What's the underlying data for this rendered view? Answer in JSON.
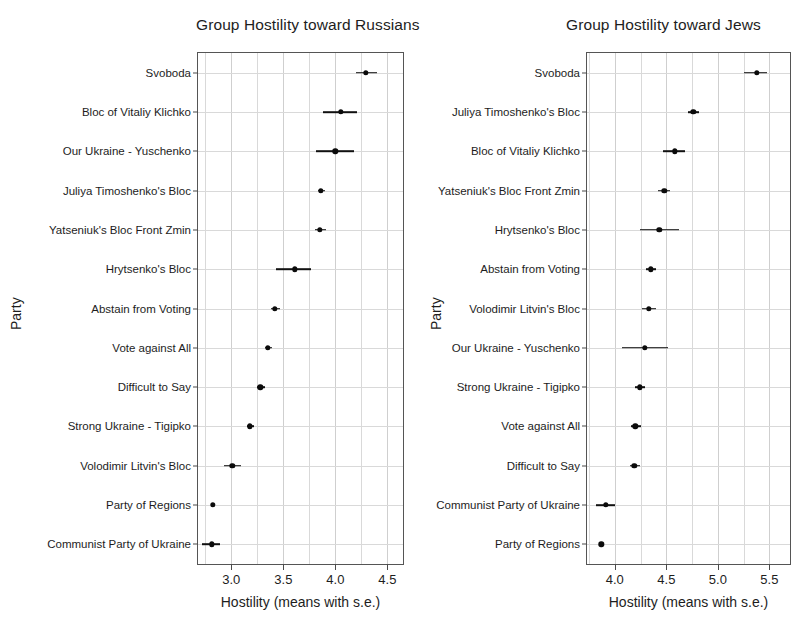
{
  "figure": {
    "y_axis_title": "Party",
    "x_axis_title": "Hostility (means with s.e.)"
  },
  "chart_data": [
    {
      "type": "scatter",
      "panel_id": "russians",
      "title": "Group Hostility toward Russians",
      "xlabel": "Hostility (means with s.e.)",
      "ylabel": "Party",
      "xlim": [
        2.68,
        4.65
      ],
      "xticks": [
        3.0,
        3.5,
        4.0,
        4.5
      ],
      "xticklabels": [
        "3.0",
        "3.5",
        "4.0",
        "4.5"
      ],
      "grid": true,
      "grid_step": 0.25,
      "orientation": "horizontal",
      "error_type": "standard error",
      "categories": [
        "Svoboda",
        "Bloc of Vitaliy Klichko",
        "Our Ukraine - Yuschenko",
        "Juliya Timoshenko's Bloc",
        "Yatseniuk's Bloc Front Zmin",
        "Hrytsenko's Bloc",
        "Abstain from Voting",
        "Vote against All",
        "Difficult to Say",
        "Strong Ukraine - Tigipko",
        "Volodimir Litvin's Bloc",
        "Party of Regions",
        "Communist Party of Ukraine"
      ],
      "values": [
        4.29,
        4.05,
        4.0,
        3.86,
        3.85,
        3.61,
        3.42,
        3.35,
        3.28,
        3.18,
        3.01,
        2.82,
        2.81
      ],
      "err_low": [
        4.2,
        3.88,
        3.81,
        3.83,
        3.8,
        3.43,
        3.38,
        3.32,
        3.25,
        3.15,
        2.93,
        2.81,
        2.72
      ],
      "err_high": [
        4.4,
        4.21,
        4.18,
        3.9,
        3.91,
        3.77,
        3.47,
        3.39,
        3.32,
        3.22,
        3.09,
        2.83,
        2.89
      ]
    },
    {
      "type": "scatter",
      "panel_id": "jews",
      "title": "Group Hostility toward Jews",
      "xlabel": "Hostility (means with s.e.)",
      "ylabel": "Party",
      "xlim": [
        3.73,
        5.7
      ],
      "xticks": [
        4.0,
        4.5,
        5.0,
        5.5
      ],
      "xticklabels": [
        "4.0",
        "4.5",
        "5.0",
        "5.5"
      ],
      "grid": true,
      "grid_step": 0.25,
      "orientation": "horizontal",
      "error_type": "standard error",
      "categories": [
        "Svoboda",
        "Juliya Timoshenko's Bloc",
        "Bloc of Vitaliy Klichko",
        "Yatseniuk's Bloc Front Zmin",
        "Hrytsenko's Bloc",
        "Abstain from Voting",
        "Volodimir Litvin's Bloc",
        "Our Ukraine - Yuschenko",
        "Strong Ukraine - Tigipko",
        "Vote against All",
        "Difficult to Say",
        "Communist Party of Ukraine",
        "Party of Regions"
      ],
      "values": [
        5.38,
        4.76,
        4.58,
        4.48,
        4.43,
        4.35,
        4.33,
        4.29,
        4.24,
        4.2,
        4.19,
        3.91,
        3.87
      ],
      "err_low": [
        5.25,
        4.71,
        4.47,
        4.42,
        4.24,
        4.3,
        4.26,
        4.07,
        4.2,
        4.16,
        4.15,
        3.82,
        3.86
      ],
      "err_high": [
        5.48,
        4.82,
        4.68,
        4.54,
        4.62,
        4.4,
        4.4,
        4.52,
        4.29,
        4.25,
        4.24,
        4.0,
        3.88
      ]
    }
  ]
}
